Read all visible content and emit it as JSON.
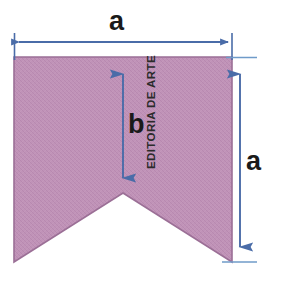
{
  "figure": {
    "background_color": "#ffffff",
    "credit": "EDITORIA DE ARTE",
    "shape": {
      "name": "notched-pentagon",
      "fill_color": "#c093b8",
      "stroke_color": "#9b6f96",
      "texture": "fine crosshatch",
      "vertices": [
        {
          "x": 14,
          "y": 57
        },
        {
          "x": 232,
          "y": 57
        },
        {
          "x": 232,
          "y": 262
        },
        {
          "x": 123,
          "y": 193
        },
        {
          "x": 14,
          "y": 262
        }
      ]
    },
    "dimensions": [
      {
        "label": "a",
        "orientation": "horizontal",
        "description": "top width of the shape",
        "from": {
          "x": 14,
          "y": 42
        },
        "to": {
          "x": 232,
          "y": 42
        },
        "label_position": {
          "x": 109,
          "y": 8
        },
        "color": "#4a6ca8"
      },
      {
        "label": "b",
        "orientation": "vertical",
        "description": "height from top edge down to the notch vertex",
        "from": {
          "x": 123,
          "y": 60
        },
        "to": {
          "x": 123,
          "y": 191
        },
        "label_position": {
          "x": 128,
          "y": 111
        },
        "color": "#4a6ca8"
      },
      {
        "label": "a",
        "orientation": "vertical",
        "description": "full side height of the shape",
        "from": {
          "x": 240,
          "y": 59
        },
        "to": {
          "x": 240,
          "y": 261
        },
        "label_position": {
          "x": 246,
          "y": 148
        },
        "color": "#4a6ca8"
      }
    ],
    "extension_lines": [
      {
        "name": "left-top-extension",
        "x1": 14,
        "y1": 33,
        "x2": 14,
        "y2": 59
      },
      {
        "name": "right-top-extension",
        "x1": 232,
        "y1": 33,
        "x2": 232,
        "y2": 59
      },
      {
        "name": "top-right-tick",
        "x1": 228,
        "y1": 57,
        "x2": 256,
        "y2": 57
      },
      {
        "name": "bottom-right-tick",
        "x1": 224,
        "y1": 262,
        "x2": 256,
        "y2": 262
      }
    ],
    "colors": {
      "arrow": "#4a6ca8",
      "shape_fill": "#c093b8",
      "shape_stroke": "#9b6f96",
      "label_text": "#1a1a1a",
      "credit_text": "#2b2b2b"
    }
  }
}
